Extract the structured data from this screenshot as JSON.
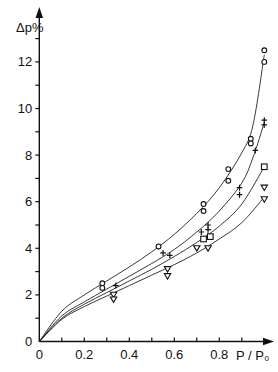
{
  "chart_data": {
    "type": "scatter",
    "title": "",
    "xlabel": "P / P₀",
    "ylabel": "Δp%",
    "xlim": [
      0,
      1.05
    ],
    "ylim": [
      0,
      13.5
    ],
    "grid": false,
    "legend": "none",
    "x_ticks": [
      "0",
      "0.2",
      "0.4",
      "0.6",
      "0.8"
    ],
    "y_ticks": [
      "0",
      "2",
      "4",
      "6",
      "8",
      "10",
      "12"
    ],
    "series": [
      {
        "name": "circle",
        "marker": "circle",
        "points": [
          [
            0.28,
            2.5
          ],
          [
            0.28,
            2.3
          ],
          [
            0.53,
            4.08
          ],
          [
            0.73,
            5.9
          ],
          [
            0.73,
            5.6
          ],
          [
            0.84,
            7.4
          ],
          [
            0.84,
            6.9
          ],
          [
            0.94,
            8.7
          ],
          [
            0.94,
            8.5
          ],
          [
            1.0,
            12.5
          ],
          [
            1.0,
            12.0
          ]
        ],
        "fit_curve": [
          [
            0,
            0
          ],
          [
            0.1,
            1.3
          ],
          [
            0.2,
            2.0
          ],
          [
            0.3,
            2.6
          ],
          [
            0.4,
            3.2
          ],
          [
            0.5,
            3.85
          ],
          [
            0.6,
            4.6
          ],
          [
            0.7,
            5.5
          ],
          [
            0.8,
            6.6
          ],
          [
            0.9,
            8.1
          ],
          [
            0.95,
            9.3
          ],
          [
            1.0,
            12.3
          ]
        ]
      },
      {
        "name": "cross",
        "marker": "cross",
        "points": [
          [
            0.34,
            2.4
          ],
          [
            0.55,
            3.8
          ],
          [
            0.58,
            3.7
          ],
          [
            0.72,
            4.7
          ],
          [
            0.75,
            5.0
          ],
          [
            0.75,
            4.8
          ],
          [
            0.89,
            6.6
          ],
          [
            0.89,
            6.3
          ],
          [
            0.96,
            8.2
          ],
          [
            1.0,
            9.5
          ],
          [
            1.0,
            9.3
          ]
        ],
        "fit_curve": [
          [
            0,
            0
          ],
          [
            0.1,
            1.1
          ],
          [
            0.2,
            1.7
          ],
          [
            0.3,
            2.25
          ],
          [
            0.4,
            2.8
          ],
          [
            0.5,
            3.35
          ],
          [
            0.6,
            3.95
          ],
          [
            0.7,
            4.7
          ],
          [
            0.8,
            5.6
          ],
          [
            0.9,
            6.8
          ],
          [
            0.95,
            7.9
          ],
          [
            1.0,
            9.4
          ]
        ]
      },
      {
        "name": "square",
        "marker": "square",
        "points": [
          [
            0.73,
            4.4
          ],
          [
            0.76,
            4.5
          ],
          [
            1.0,
            7.5
          ]
        ],
        "fit_curve": [
          [
            0,
            0
          ],
          [
            0.1,
            1.0
          ],
          [
            0.2,
            1.6
          ],
          [
            0.3,
            2.1
          ],
          [
            0.4,
            2.6
          ],
          [
            0.5,
            3.1
          ],
          [
            0.6,
            3.65
          ],
          [
            0.7,
            4.25
          ],
          [
            0.8,
            4.95
          ],
          [
            0.9,
            5.9
          ],
          [
            1.0,
            7.5
          ]
        ]
      },
      {
        "name": "triangle",
        "marker": "triangle-down",
        "points": [
          [
            0.33,
            2.0
          ],
          [
            0.33,
            1.8
          ],
          [
            0.57,
            3.1
          ],
          [
            0.57,
            2.8
          ],
          [
            0.7,
            4.0
          ],
          [
            0.75,
            4.0
          ],
          [
            1.0,
            6.6
          ],
          [
            1.0,
            6.1
          ]
        ],
        "fit_curve": [
          [
            0,
            0
          ],
          [
            0.1,
            0.95
          ],
          [
            0.2,
            1.5
          ],
          [
            0.3,
            1.95
          ],
          [
            0.4,
            2.4
          ],
          [
            0.5,
            2.85
          ],
          [
            0.6,
            3.3
          ],
          [
            0.7,
            3.8
          ],
          [
            0.8,
            4.4
          ],
          [
            0.9,
            5.1
          ],
          [
            1.0,
            6.2
          ]
        ]
      }
    ]
  }
}
